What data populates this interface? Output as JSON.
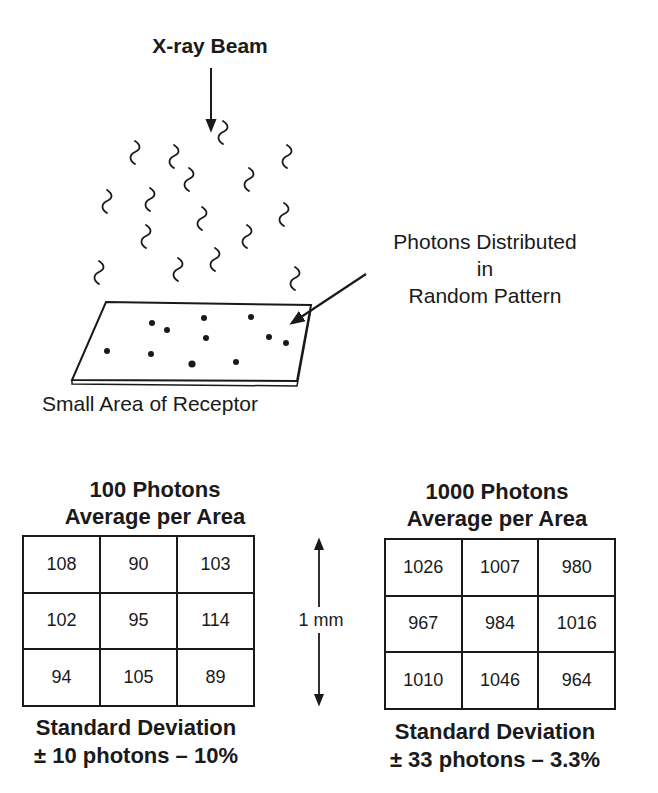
{
  "diagram": {
    "beam_label": "X-ray Beam",
    "photons_label_lines": [
      "Photons Distributed",
      "in",
      "Random Pattern"
    ],
    "receptor_label": "Small Area of Receptor",
    "scale_label": "1 mm"
  },
  "left_panel": {
    "title_line1": "100 Photons",
    "title_line2": "Average per Area",
    "grid": [
      [
        "108",
        "90",
        "103"
      ],
      [
        "102",
        "95",
        "114"
      ],
      [
        "94",
        "105",
        "89"
      ]
    ],
    "footer_line1": "Standard Deviation",
    "footer_line2": "± 10 photons – 10%"
  },
  "right_panel": {
    "title_line1": "1000 Photons",
    "title_line2": "Average per Area",
    "grid": [
      [
        "1026",
        "1007",
        "980"
      ],
      [
        "967",
        "984",
        "1016"
      ],
      [
        "1010",
        "1046",
        "964"
      ]
    ],
    "footer_line1": "Standard Deviation",
    "footer_line2": "± 33 photons – 3.3%"
  },
  "colors": {
    "ink": "#1a1a1a",
    "background": "#ffffff"
  }
}
